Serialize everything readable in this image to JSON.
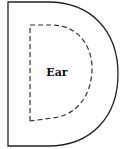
{
  "diagram": {
    "outer_shape": {
      "type": "D-shape",
      "stroke": "#222222",
      "stroke_style": "solid"
    },
    "inner_shape": {
      "type": "D-shape",
      "stroke": "#333333",
      "stroke_style": "dashed",
      "label": "Ear"
    },
    "background": "#ffffff"
  }
}
